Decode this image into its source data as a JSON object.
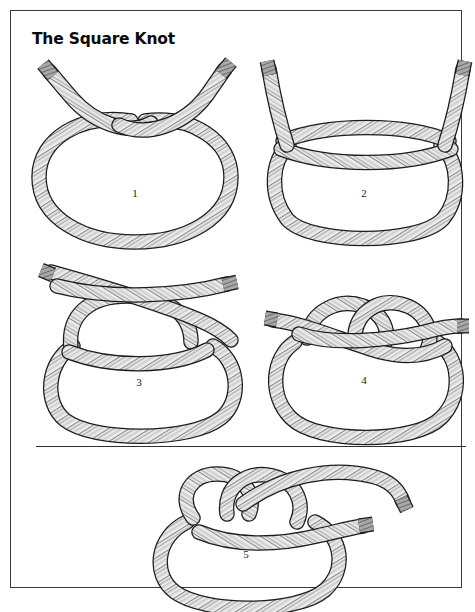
{
  "page": {
    "title": "The Square Knot",
    "background_color": "#ffffff",
    "border_color": "#3a3a3a",
    "divider_color": "#2e2e2e"
  },
  "rope_style": {
    "fill": "#e9e9e9",
    "outline": "#1b1b1b",
    "strand_line": "#2a2a2a",
    "shade": "#c9c9c9",
    "whipping": "#8d8d8d",
    "whipping_dark": "#5a5a5a"
  },
  "steps": [
    {
      "number": "1",
      "caption_number": "1",
      "description": "Loop formed with both working ends crossed above the bight"
    },
    {
      "number": "2",
      "caption_number": "2",
      "description": "Ends twisted once across the top of the loop"
    },
    {
      "number": "3",
      "caption_number": "3",
      "description": "A second bight pulled up and the ends laid over it"
    },
    {
      "number": "4",
      "caption_number": "4",
      "description": "Ends drawn through forming the square knot"
    },
    {
      "number": "5",
      "caption_number": "5",
      "description": "Completed square knot with both ends running free"
    }
  ]
}
